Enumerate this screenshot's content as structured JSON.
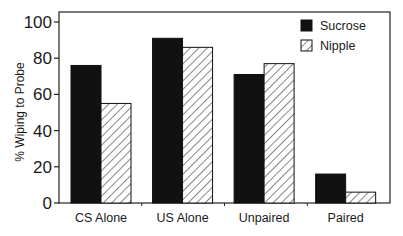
{
  "chart_data": {
    "type": "bar",
    "title": "",
    "xlabel": "",
    "ylabel": "% Wiping to Probe",
    "ylim": [
      0,
      100
    ],
    "yticks": [
      0,
      20,
      40,
      60,
      80,
      100
    ],
    "grid": false,
    "legend_position": "upper right (inside)",
    "categories": [
      "CS Alone",
      "US Alone",
      "Unpaired",
      "Paired"
    ],
    "series": [
      {
        "name": "Sucrose",
        "fill": "solid",
        "color": "#111111",
        "values": [
          76,
          91,
          71,
          16
        ]
      },
      {
        "name": "Nipple",
        "fill": "hatched",
        "color": "#ffffff",
        "values": [
          55,
          86,
          77,
          6
        ]
      }
    ]
  }
}
